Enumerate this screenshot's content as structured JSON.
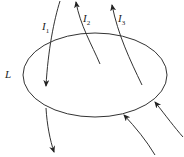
{
  "diagram": {
    "title": "",
    "loop": {
      "label": "L",
      "cx": 95,
      "cy": 75,
      "rx": 72,
      "ry": 42
    },
    "currents": [
      {
        "symbol": "I",
        "subscript": "1",
        "direction": "down-through-loop"
      },
      {
        "symbol": "I",
        "subscript": "2",
        "direction": "up-from-inside"
      },
      {
        "symbol": "I",
        "subscript": "3",
        "direction": "up-from-inside"
      }
    ],
    "external_currents": [
      {
        "label": "",
        "direction": "down-exiting-below-loop"
      },
      {
        "label": "",
        "direction": "up-into-loop-bottom"
      },
      {
        "label": "",
        "direction": "up-toward-loop-right"
      }
    ],
    "colors": {
      "stroke": "#333333",
      "background": "#ffffff"
    }
  }
}
